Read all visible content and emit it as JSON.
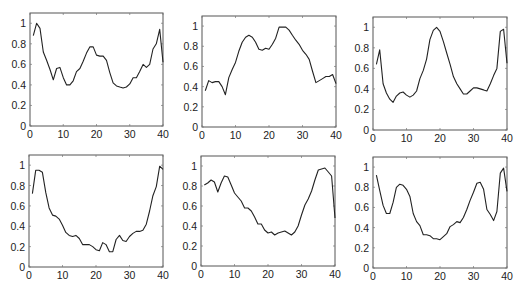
{
  "chart_data": [
    {
      "type": "line",
      "title": "",
      "xlabel": "",
      "ylabel": "",
      "xlim": [
        0,
        40
      ],
      "ylim": [
        0,
        1.1
      ],
      "grid": false,
      "xticks": [
        0,
        10,
        20,
        30,
        40
      ],
      "yticks": [
        0,
        0.2,
        0.4,
        0.6,
        0.8,
        1
      ],
      "x": [
        1,
        2,
        3,
        4,
        5,
        6,
        7,
        8,
        9,
        10,
        11,
        12,
        13,
        14,
        15,
        16,
        17,
        18,
        19,
        20,
        21,
        22,
        23,
        24,
        25,
        26,
        27,
        28,
        29,
        30,
        31,
        32,
        33,
        34,
        35,
        36,
        37,
        38,
        39,
        40
      ],
      "values": [
        0.88,
        1.0,
        0.95,
        0.72,
        0.64,
        0.55,
        0.45,
        0.56,
        0.57,
        0.47,
        0.4,
        0.4,
        0.44,
        0.53,
        0.56,
        0.63,
        0.71,
        0.77,
        0.77,
        0.69,
        0.68,
        0.68,
        0.64,
        0.52,
        0.42,
        0.39,
        0.38,
        0.37,
        0.38,
        0.41,
        0.47,
        0.47,
        0.53,
        0.6,
        0.57,
        0.6,
        0.75,
        0.8,
        0.94,
        0.62
      ]
    },
    {
      "type": "line",
      "title": "",
      "xlabel": "",
      "ylabel": "",
      "xlim": [
        0,
        40
      ],
      "ylim": [
        0,
        1.1
      ],
      "grid": false,
      "xticks": [
        0,
        10,
        20,
        30,
        40
      ],
      "yticks": [
        0,
        0.2,
        0.4,
        0.6,
        0.8,
        1
      ],
      "x": [
        1,
        2,
        3,
        4,
        5,
        6,
        7,
        8,
        9,
        10,
        11,
        12,
        13,
        14,
        15,
        16,
        17,
        18,
        19,
        20,
        21,
        22,
        23,
        24,
        25,
        26,
        27,
        28,
        29,
        30,
        31,
        32,
        33,
        34,
        35,
        36,
        37,
        38,
        39,
        40
      ],
      "values": [
        0.36,
        0.46,
        0.44,
        0.45,
        0.45,
        0.4,
        0.32,
        0.49,
        0.57,
        0.64,
        0.75,
        0.84,
        0.89,
        0.91,
        0.89,
        0.84,
        0.77,
        0.76,
        0.78,
        0.77,
        0.82,
        0.88,
        0.99,
        0.99,
        0.99,
        0.96,
        0.91,
        0.86,
        0.82,
        0.76,
        0.72,
        0.67,
        0.55,
        0.44,
        0.46,
        0.48,
        0.5,
        0.5,
        0.52,
        0.43
      ]
    },
    {
      "type": "line",
      "title": "",
      "xlabel": "",
      "ylabel": "",
      "xlim": [
        0,
        40
      ],
      "ylim": [
        0,
        1.1
      ],
      "grid": false,
      "xticks": [
        0,
        10,
        20,
        30,
        40
      ],
      "yticks": [
        0,
        0.2,
        0.4,
        0.6,
        0.8,
        1
      ],
      "x": [
        1,
        2,
        3,
        4,
        5,
        6,
        7,
        8,
        9,
        10,
        11,
        12,
        13,
        14,
        15,
        16,
        17,
        18,
        19,
        20,
        21,
        22,
        23,
        24,
        25,
        26,
        27,
        28,
        29,
        30,
        31,
        32,
        33,
        34,
        35,
        36,
        37,
        38,
        39,
        40
      ],
      "values": [
        0.64,
        0.78,
        0.45,
        0.36,
        0.3,
        0.27,
        0.33,
        0.36,
        0.37,
        0.34,
        0.32,
        0.34,
        0.38,
        0.5,
        0.58,
        0.69,
        0.88,
        0.97,
        1.0,
        0.96,
        0.86,
        0.75,
        0.64,
        0.52,
        0.45,
        0.4,
        0.35,
        0.35,
        0.38,
        0.41,
        0.41,
        0.4,
        0.39,
        0.38,
        0.45,
        0.53,
        0.6,
        0.96,
        0.98,
        0.65
      ]
    },
    {
      "type": "line",
      "title": "",
      "xlabel": "",
      "ylabel": "",
      "xlim": [
        0,
        40
      ],
      "ylim": [
        0,
        1.1
      ],
      "grid": false,
      "xticks": [
        0,
        10,
        20,
        30,
        40
      ],
      "yticks": [
        0,
        0.2,
        0.4,
        0.6,
        0.8,
        1
      ],
      "x": [
        1,
        2,
        3,
        4,
        5,
        6,
        7,
        8,
        9,
        10,
        11,
        12,
        13,
        14,
        15,
        16,
        17,
        18,
        19,
        20,
        21,
        22,
        23,
        24,
        25,
        26,
        27,
        28,
        29,
        30,
        31,
        32,
        33,
        34,
        35,
        36,
        37,
        38,
        39,
        40
      ],
      "values": [
        0.72,
        0.95,
        0.95,
        0.93,
        0.73,
        0.58,
        0.51,
        0.5,
        0.47,
        0.41,
        0.34,
        0.31,
        0.3,
        0.31,
        0.28,
        0.22,
        0.22,
        0.22,
        0.2,
        0.17,
        0.16,
        0.24,
        0.22,
        0.15,
        0.15,
        0.27,
        0.31,
        0.26,
        0.25,
        0.3,
        0.33,
        0.35,
        0.35,
        0.36,
        0.42,
        0.55,
        0.7,
        0.79,
        0.99,
        0.96
      ]
    },
    {
      "type": "line",
      "title": "",
      "xlabel": "",
      "ylabel": "",
      "xlim": [
        0,
        40
      ],
      "ylim": [
        0,
        1.1
      ],
      "grid": false,
      "xticks": [
        0,
        10,
        20,
        30,
        40
      ],
      "yticks": [
        0,
        0.2,
        0.4,
        0.6,
        0.8,
        1
      ],
      "x": [
        1,
        2,
        3,
        4,
        5,
        6,
        7,
        8,
        9,
        10,
        11,
        12,
        13,
        14,
        15,
        16,
        17,
        18,
        19,
        20,
        21,
        22,
        23,
        24,
        25,
        26,
        27,
        28,
        29,
        30,
        31,
        32,
        33,
        34,
        35,
        36,
        37,
        38,
        39,
        40
      ],
      "values": [
        0.81,
        0.83,
        0.86,
        0.84,
        0.74,
        0.83,
        0.9,
        0.89,
        0.81,
        0.73,
        0.69,
        0.65,
        0.58,
        0.58,
        0.55,
        0.49,
        0.42,
        0.42,
        0.36,
        0.33,
        0.34,
        0.31,
        0.33,
        0.34,
        0.35,
        0.33,
        0.31,
        0.34,
        0.4,
        0.51,
        0.61,
        0.67,
        0.75,
        0.86,
        0.96,
        0.97,
        0.98,
        0.94,
        0.9,
        0.48
      ]
    },
    {
      "type": "line",
      "title": "",
      "xlabel": "",
      "ylabel": "",
      "xlim": [
        0,
        40
      ],
      "ylim": [
        0,
        1.1
      ],
      "grid": false,
      "xticks": [
        0,
        10,
        20,
        30,
        40
      ],
      "yticks": [
        0,
        0.2,
        0.4,
        0.6,
        0.8,
        1
      ],
      "x": [
        1,
        2,
        3,
        4,
        5,
        6,
        7,
        8,
        9,
        10,
        11,
        12,
        13,
        14,
        15,
        16,
        17,
        18,
        19,
        20,
        21,
        22,
        23,
        24,
        25,
        26,
        27,
        28,
        29,
        30,
        31,
        32,
        33,
        34,
        35,
        36,
        37,
        38,
        39,
        40
      ],
      "values": [
        0.92,
        0.77,
        0.62,
        0.54,
        0.54,
        0.65,
        0.8,
        0.83,
        0.82,
        0.78,
        0.71,
        0.54,
        0.46,
        0.42,
        0.33,
        0.33,
        0.32,
        0.29,
        0.29,
        0.28,
        0.31,
        0.34,
        0.41,
        0.43,
        0.46,
        0.45,
        0.5,
        0.58,
        0.67,
        0.75,
        0.84,
        0.85,
        0.78,
        0.58,
        0.53,
        0.47,
        0.56,
        0.94,
        0.99,
        0.76
      ]
    }
  ],
  "layout": {
    "panels": [
      {
        "left": 30,
        "top": 13,
        "right": 163,
        "bottom": 126
      },
      {
        "left": 202,
        "top": 16,
        "right": 336,
        "bottom": 127
      },
      {
        "left": 373,
        "top": 17,
        "right": 507,
        "bottom": 130
      },
      {
        "left": 29,
        "top": 155,
        "right": 163,
        "bottom": 267
      },
      {
        "left": 201,
        "top": 156,
        "right": 335,
        "bottom": 266
      },
      {
        "left": 373,
        "top": 157,
        "right": 507,
        "bottom": 268
      }
    ]
  }
}
